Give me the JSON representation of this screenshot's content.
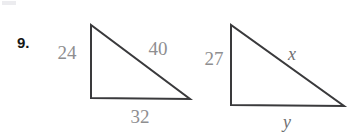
{
  "page": {
    "background_color": "#ffffff",
    "width": 358,
    "height": 133
  },
  "problem": {
    "number_label": "9.",
    "number_color": "#161616"
  },
  "style": {
    "stroke_color": "#3a3a3c",
    "stroke_width": 2,
    "label_color": "#8e8e90",
    "variable_color": "#6f6f72"
  },
  "figures": [
    {
      "name": "left-triangle",
      "kind": "right-triangle",
      "vertices": {
        "apex": [
          91,
          25
        ],
        "bottom_left": [
          91,
          98
        ],
        "bottom_right": [
          190,
          99
        ]
      },
      "labels": {
        "vertical_leg": "24",
        "hypotenuse": "40",
        "base": "32"
      },
      "label_positions": {
        "vertical_leg": [
          67,
          52
        ],
        "hypotenuse": [
          158,
          48
        ],
        "base": [
          140,
          116
        ]
      }
    },
    {
      "name": "right-triangle",
      "kind": "right-triangle",
      "vertices": {
        "apex": [
          231,
          25
        ],
        "bottom_left": [
          231,
          105
        ],
        "bottom_right": [
          344,
          106
        ]
      },
      "labels": {
        "vertical_leg": "27",
        "hypotenuse": "x",
        "base": "y"
      },
      "label_positions": {
        "vertical_leg": [
          214,
          58
        ],
        "hypotenuse": [
          292,
          54
        ],
        "base": [
          287,
          122
        ]
      }
    }
  ]
}
